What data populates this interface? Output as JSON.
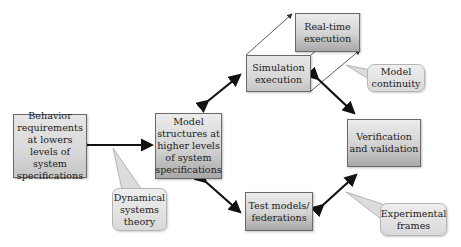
{
  "diagram": {
    "nodes": {
      "behavior": {
        "label": "Behavior requirements at lowers levels of system specifications"
      },
      "model_structures": {
        "label": "Model structures at higher levels of system specifications"
      },
      "simulation": {
        "label": "Simulation execution"
      },
      "realtime": {
        "label": "Real-time execution"
      },
      "verification": {
        "label": "Verification and validation"
      },
      "test_models": {
        "label": "Test models/ federations"
      }
    },
    "callouts": {
      "dynamical": {
        "label": "Dynamical systems theory"
      },
      "model_continuity": {
        "label": "Model continuity"
      },
      "experimental": {
        "label": "Experimental frames"
      }
    },
    "edges": [
      {
        "from": "behavior",
        "to": "model_structures",
        "type": "bidirectional"
      },
      {
        "from": "model_structures",
        "to": "simulation",
        "type": "bidirectional"
      },
      {
        "from": "model_structures",
        "to": "test_models",
        "type": "bidirectional"
      },
      {
        "from": "simulation",
        "to": "verification",
        "type": "bidirectional"
      },
      {
        "from": "test_models",
        "to": "verification",
        "type": "bidirectional"
      },
      {
        "from": "simulation",
        "to": "realtime",
        "type": "projection"
      }
    ],
    "colors": {
      "box_fill_top": "#ececec",
      "box_fill_bottom": "#a8a8a8",
      "arrow": "#111111",
      "callout_fill": "#e0e0e0"
    }
  }
}
